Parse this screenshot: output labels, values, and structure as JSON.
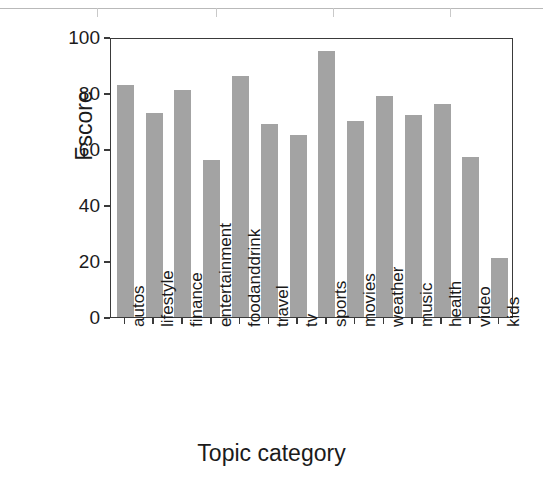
{
  "figure": {
    "background_color": "#ffffff",
    "bar_color": "#a3a3a3",
    "axis_color": "#3a3a3a",
    "text_color": "#1b1b1b"
  },
  "scan_artifact": {
    "name": "table-bottom-rule",
    "tick_positions": [
      97,
      216,
      333,
      450
    ]
  },
  "chart_data": {
    "type": "bar",
    "title": "",
    "xlabel": "Topic category",
    "ylabel": "Fscore",
    "categories": [
      "autos",
      "lifestyle",
      "finance",
      "entertainment",
      "foodanddrink",
      "travel",
      "tv",
      "sports",
      "movies",
      "weather",
      "music",
      "health",
      "video",
      "kids"
    ],
    "values": [
      83,
      73,
      81,
      56,
      86,
      69,
      65,
      95,
      70,
      79,
      72,
      76,
      57,
      21
    ],
    "ylim": [
      0,
      100
    ],
    "ytick_labels": [
      "0",
      "20",
      "40",
      "60",
      "80",
      "100"
    ],
    "yticks": [
      0,
      20,
      40,
      60,
      80,
      100
    ],
    "grid": false,
    "legend": false,
    "legend_position": "none",
    "xtick_label_rotation": -90
  }
}
